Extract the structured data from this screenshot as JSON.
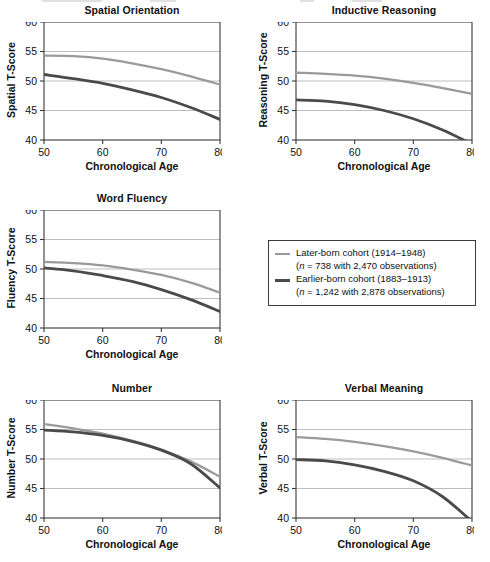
{
  "chart_data": {
    "type": "line",
    "title": "",
    "xlabel": "Chronological Age",
    "xlim": [
      50,
      80
    ],
    "xticks": [
      50,
      60,
      70,
      80
    ],
    "ylim": [
      40,
      60
    ],
    "yticks": [
      40,
      45,
      50,
      55,
      60
    ],
    "grid": "horizontal gridlines at 45, 50, 55",
    "legend_position": "middle-right panel slot",
    "x": [
      50,
      55,
      60,
      65,
      70,
      75,
      80
    ],
    "series_names": [
      "Later-born cohort (1914–1948)",
      "Earlier-born cohort (1883–1913)"
    ],
    "panels": [
      {
        "title": "Spatial Orientation",
        "ylabel": "Spatial T-Score",
        "series": [
          {
            "name": "Later-born cohort (1914–1948)",
            "values": [
              54.3,
              54.2,
              53.8,
              53.0,
              52.0,
              50.8,
              49.4
            ]
          },
          {
            "name": "Earlier-born cohort (1883–1913)",
            "values": [
              51.1,
              50.4,
              49.6,
              48.5,
              47.2,
              45.5,
              43.5
            ]
          }
        ]
      },
      {
        "title": "Inductive Reasoning",
        "ylabel": "Reasoning T-Score",
        "series": [
          {
            "name": "Later-born cohort (1914–1948)",
            "values": [
              51.4,
              51.2,
              50.9,
              50.4,
              49.7,
              48.8,
              47.8
            ]
          },
          {
            "name": "Earlier-born cohort (1883–1913)",
            "values": [
              46.8,
              46.6,
              46.0,
              45.0,
              43.6,
              41.7,
              39.3
            ]
          }
        ]
      },
      {
        "title": "Word Fluency",
        "ylabel": "Fluency T-Score",
        "series": [
          {
            "name": "Later-born cohort (1914–1948)",
            "values": [
              51.2,
              51.0,
              50.6,
              49.9,
              49.0,
              47.7,
              46.0
            ]
          },
          {
            "name": "Earlier-born cohort (1883–1913)",
            "values": [
              50.2,
              49.7,
              48.9,
              47.9,
              46.5,
              44.8,
              42.8
            ]
          }
        ]
      },
      {
        "title": "Number",
        "ylabel": "Number T-Score",
        "series": [
          {
            "name": "Later-born cohort (1914–1948)",
            "values": [
              55.9,
              55.2,
              54.3,
              53.1,
              51.6,
              49.6,
              47.0
            ]
          },
          {
            "name": "Earlier-born cohort (1883–1913)",
            "values": [
              54.9,
              54.6,
              54.0,
              53.0,
              51.5,
              49.2,
              45.1
            ]
          }
        ]
      },
      {
        "title": "Verbal Meaning",
        "ylabel": "Verbal T-Score",
        "series": [
          {
            "name": "Later-born cohort (1914–1948)",
            "values": [
              53.7,
              53.4,
              52.9,
              52.2,
              51.3,
              50.2,
              48.9
            ]
          },
          {
            "name": "Earlier-born cohort (1883–1913)",
            "values": [
              49.9,
              49.7,
              49.0,
              47.9,
              46.3,
              43.6,
              39.4
            ]
          }
        ]
      }
    ]
  },
  "legend": {
    "entries": [
      {
        "swatch": "light",
        "label": "Later-born cohort (1914–1948)",
        "detail_prefix": "(",
        "detail_italic": "n",
        "detail_suffix": " = 738 with 2,470 observations)"
      },
      {
        "swatch": "dark",
        "label": "Earlier-born cohort (1883–1913)",
        "detail_prefix": "(",
        "detail_italic": "n",
        "detail_suffix": " = 1,242 with 2,878 observations)"
      }
    ]
  },
  "colors": {
    "later_born_line": "#9a9a9a",
    "earlier_born_line": "#4a4a4a",
    "axis": "#3a3a3a",
    "gridline": "#b5b5b5",
    "text": "#111111",
    "background": "#ffffff"
  }
}
